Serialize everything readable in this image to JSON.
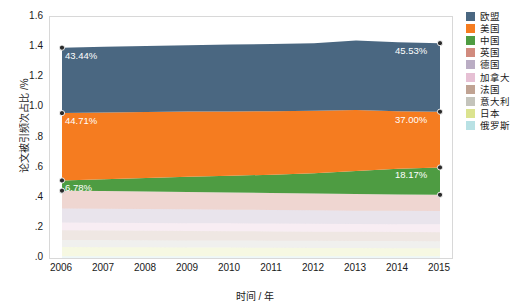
{
  "chart_data": {
    "type": "area",
    "stacked": true,
    "title": "",
    "xlabel": "时间 / 年",
    "ylabel": "论文被引频次占比 /%",
    "x": [
      2006,
      2007,
      2008,
      2009,
      2010,
      2011,
      2012,
      2013,
      2014,
      2015
    ],
    "xticklabels": [
      "2006",
      "2007",
      "2008",
      "2009",
      "2010",
      "2011",
      "2012",
      "2013",
      "2014",
      "2015"
    ],
    "yticklabels": [
      ".0",
      ".2",
      ".4",
      ".6",
      ".8",
      "1.0",
      "1.2",
      "1.4",
      "1.6"
    ],
    "ytickvalues": [
      0.0,
      0.2,
      0.4,
      0.6,
      0.8,
      1.0,
      1.2,
      1.4,
      1.6
    ],
    "ylim": [
      0.0,
      1.6
    ],
    "grid": false,
    "legend_position": "right",
    "series": [
      {
        "name": "欧盟",
        "color": "#4a6781",
        "values": [
          0.4344,
          0.436,
          0.438,
          0.441,
          0.444,
          0.447,
          0.448,
          0.462,
          0.458,
          0.4553
        ]
      },
      {
        "name": "美国",
        "color": "#f57c20",
        "values": [
          0.4471,
          0.443,
          0.438,
          0.433,
          0.427,
          0.421,
          0.415,
          0.405,
          0.382,
          0.37
        ]
      },
      {
        "name": "中国",
        "color": "#4e9c42",
        "values": [
          0.0678,
          0.079,
          0.09,
          0.101,
          0.111,
          0.121,
          0.133,
          0.153,
          0.17,
          0.1817
        ]
      },
      {
        "name": "英国",
        "color": "#b5442e",
        "values": [
          0.118,
          0.117,
          0.116,
          0.115,
          0.114,
          0.113,
          0.112,
          0.11,
          0.109,
          0.108
        ]
      },
      {
        "name": "德国",
        "color": "#8f7aa0",
        "values": [
          0.093,
          0.0925,
          0.092,
          0.0915,
          0.091,
          0.0905,
          0.09,
          0.089,
          0.0885,
          0.088
        ]
      },
      {
        "name": "加拿大",
        "color": "#d79aba",
        "values": [
          0.052,
          0.052,
          0.052,
          0.052,
          0.052,
          0.052,
          0.052,
          0.052,
          0.052,
          0.052
        ]
      },
      {
        "name": "法国",
        "color": "#9a6b50",
        "values": [
          0.064,
          0.0635,
          0.063,
          0.0625,
          0.062,
          0.0615,
          0.061,
          0.0605,
          0.06,
          0.0595
        ]
      },
      {
        "name": "意大利",
        "color": "#9f9f93",
        "values": [
          0.047,
          0.047,
          0.047,
          0.047,
          0.047,
          0.047,
          0.047,
          0.047,
          0.047,
          0.047
        ]
      },
      {
        "name": "日本",
        "color": "#c5d24a",
        "values": [
          0.061,
          0.06,
          0.059,
          0.058,
          0.057,
          0.056,
          0.055,
          0.054,
          0.0535,
          0.053
        ]
      },
      {
        "name": "俄罗斯",
        "color": "#8ccfd4",
        "values": [
          0.012,
          0.012,
          0.012,
          0.012,
          0.012,
          0.012,
          0.012,
          0.012,
          0.012,
          0.012
        ]
      }
    ],
    "annotations": [
      {
        "text": "43.44%",
        "series": "欧盟",
        "side": "left"
      },
      {
        "text": "45.53%",
        "series": "欧盟",
        "side": "right"
      },
      {
        "text": "44.71%",
        "series": "美国",
        "side": "left"
      },
      {
        "text": "37.00%",
        "series": "美国",
        "side": "right"
      },
      {
        "text": "6.78%",
        "series": "中国",
        "side": "left"
      },
      {
        "text": "18.17%",
        "series": "中国",
        "side": "right"
      }
    ]
  },
  "legend": {
    "items": [
      {
        "label": "欧盟"
      },
      {
        "label": "美国"
      },
      {
        "label": "中国"
      },
      {
        "label": "英国"
      },
      {
        "label": "德国"
      },
      {
        "label": "加拿大"
      },
      {
        "label": "法国"
      },
      {
        "label": "意大利"
      },
      {
        "label": "日本"
      },
      {
        "label": "俄罗斯"
      }
    ]
  }
}
